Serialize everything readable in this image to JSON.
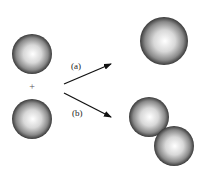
{
  "diagram": {
    "reactants": {
      "operator": "+",
      "spheres": [
        {
          "cx": 32,
          "cy": 54,
          "r": 20
        },
        {
          "cx": 32,
          "cy": 119,
          "r": 20
        }
      ]
    },
    "paths": [
      {
        "label": "(a)",
        "from": [
          64,
          84
        ],
        "to": [
          111,
          64
        ],
        "label_pos": [
          71,
          69
        ]
      },
      {
        "label": "(b)",
        "from": [
          64,
          93
        ],
        "to": [
          111,
          117
        ],
        "label_pos": [
          72,
          116
        ]
      }
    ],
    "products": {
      "a": [
        {
          "cx": 164,
          "cy": 41,
          "r": 24
        }
      ],
      "b": [
        {
          "cx": 149,
          "cy": 117,
          "r": 20
        },
        {
          "cx": 174,
          "cy": 146,
          "r": 20
        }
      ]
    },
    "colors": {
      "sphere_highlight": "#ffffff",
      "sphere_mid": "#b8b8b8",
      "sphere_edge": "#3a3a3a",
      "arrow": "#111111"
    }
  }
}
